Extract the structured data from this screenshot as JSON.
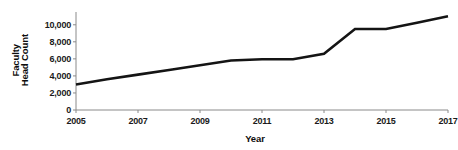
{
  "chart_data": {
    "type": "line",
    "title": "",
    "xlabel": "Year",
    "ylabel": "Faculty Head Count",
    "ylabel_lines": [
      "Faculty",
      "Head Count"
    ],
    "x": [
      2005,
      2006,
      2007,
      2008,
      2009,
      2010,
      2011,
      2012,
      2013,
      2014,
      2015,
      2016,
      2017
    ],
    "values": [
      3000,
      3600,
      4150,
      4700,
      5250,
      5800,
      5950,
      5950,
      6600,
      9500,
      9500,
      10250,
      11000
    ],
    "series": [
      {
        "name": "Faculty Head Count",
        "values": [
          3000,
          3600,
          4150,
          4700,
          5250,
          5800,
          5950,
          5950,
          6600,
          9500,
          9500,
          10250,
          11000
        ]
      }
    ],
    "xlim": [
      2005,
      2017
    ],
    "ylim": [
      0,
      11500
    ],
    "xticks": [
      2005,
      2007,
      2009,
      2011,
      2013,
      2015,
      2017
    ],
    "xtick_labels": [
      "2005",
      "2007",
      "2009",
      "2011",
      "2013",
      "2015",
      "2017"
    ],
    "yticks": [
      0,
      2000,
      4000,
      6000,
      8000,
      10000
    ],
    "ytick_labels": [
      "0",
      "2,000",
      "4,000",
      "6,000",
      "8,000",
      "10,000"
    ],
    "grid": false,
    "legend": false,
    "line_color": "#141414",
    "axis_color": "#8a8a8a",
    "background_color": "#ffffff"
  }
}
